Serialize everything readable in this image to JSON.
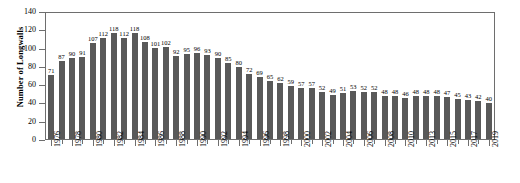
{
  "chart_data": {
    "type": "bar",
    "title": "",
    "xlabel": "",
    "ylabel": "Number of Longwalls",
    "ylim": [
      0,
      140
    ],
    "ytick_labels": [
      "0",
      "20",
      "40",
      "60",
      "80",
      "100",
      "120",
      "140"
    ],
    "ytick_values": [
      0,
      20,
      40,
      60,
      80,
      100,
      120,
      140
    ],
    "grid": false,
    "legend": null,
    "bar_color": "#595959",
    "axis_color": "#6e6e6e",
    "label_every_n_categories": 2,
    "categories": [
      "1976",
      "1977",
      "1978",
      "1979",
      "1980",
      "1981",
      "1982",
      "1983",
      "1984",
      "1985",
      "1986",
      "1987",
      "1988",
      "1989",
      "1990",
      "1991",
      "1992",
      "1993",
      "1994",
      "1995",
      "1996",
      "1997",
      "1998",
      "1999",
      "2000",
      "2001",
      "2002",
      "2003",
      "2004",
      "2005",
      "2006",
      "2007",
      "2008",
      "2009",
      "2010",
      "2011",
      "2013",
      "2014",
      "2015",
      "2016",
      "2017",
      "2018",
      "2019"
    ],
    "visible_tick_labels": [
      "1976",
      "1978",
      "1980",
      "1982",
      "1984",
      "1986",
      "1988",
      "1990",
      "1992",
      "1994",
      "1996",
      "1998",
      "2000",
      "2002",
      "2004",
      "2006",
      "2008",
      "2010",
      "2013",
      "2015",
      "2017",
      "2019"
    ],
    "values": [
      71,
      87,
      90,
      91,
      107,
      112,
      118,
      112,
      118,
      108,
      101,
      102,
      92,
      95,
      96,
      93,
      90,
      85,
      80,
      72,
      69,
      65,
      62,
      59,
      57,
      57,
      52,
      49,
      51,
      53,
      52,
      52,
      48,
      48,
      46,
      48,
      48,
      48,
      47,
      45,
      43,
      42,
      40
    ]
  }
}
